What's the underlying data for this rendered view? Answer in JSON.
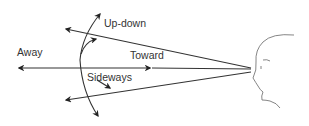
{
  "diagram": {
    "labels": {
      "up_down": "Up-down",
      "away": "Away",
      "toward": "Toward",
      "sideways": "Sideways"
    },
    "colors": {
      "line": "#333333",
      "face": "#777777",
      "text": "#333333"
    }
  }
}
